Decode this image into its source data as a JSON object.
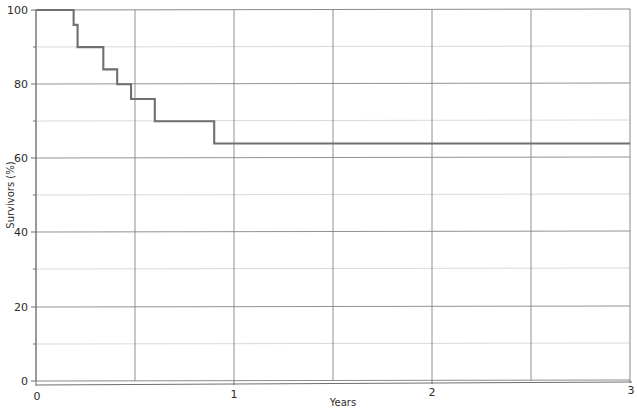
{
  "chart_data": {
    "type": "line",
    "subtype": "kaplan-meier-step",
    "title": "",
    "xlabel": "Years",
    "ylabel": "Survivors (%)",
    "xlim": [
      0,
      3
    ],
    "ylim": [
      0,
      100
    ],
    "x_ticks": [
      0,
      1,
      2,
      3
    ],
    "x_tick_labels": [
      "0",
      "1",
      "2",
      "3"
    ],
    "x_minor_ticks": [
      0.5,
      1.5,
      2.5
    ],
    "y_ticks": [
      0,
      20,
      40,
      60,
      80,
      100
    ],
    "y_tick_labels": [
      "0",
      "20",
      "40",
      "60",
      "80",
      "100"
    ],
    "y_minor_ticks": [
      10,
      30,
      50,
      70,
      90
    ],
    "grid": true,
    "grid_style": "major horizontal and vertical gridlines every 10% on y and 0.5 years on x",
    "legend": "none",
    "line_color": "#6f6f6f",
    "series": [
      {
        "name": "Survival",
        "step": "post",
        "x": [
          0.0,
          0.19,
          0.21,
          0.34,
          0.41,
          0.48,
          0.6,
          0.9,
          3.0
        ],
        "y": [
          100,
          96,
          90,
          84,
          80,
          76,
          70,
          64,
          64
        ],
        "points": [
          {
            "x": 0.0,
            "y": 100
          },
          {
            "x": 0.19,
            "y": 96
          },
          {
            "x": 0.21,
            "y": 90
          },
          {
            "x": 0.34,
            "y": 84
          },
          {
            "x": 0.41,
            "y": 80
          },
          {
            "x": 0.48,
            "y": 76
          },
          {
            "x": 0.6,
            "y": 70
          },
          {
            "x": 0.9,
            "y": 64
          },
          {
            "x": 3.0,
            "y": 64
          }
        ]
      }
    ],
    "annotations": []
  },
  "axes": {
    "y_title": "Survivors (%)",
    "x_title": "Years",
    "y_labels": [
      "100",
      "80",
      "60",
      "40",
      "20",
      "0"
    ],
    "x_labels": [
      "0",
      "1",
      "2",
      "3"
    ],
    "origin_label": "0"
  }
}
